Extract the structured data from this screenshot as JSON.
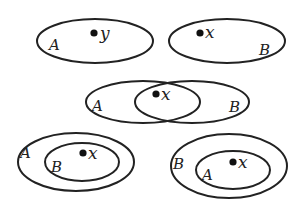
{
  "diagram": {
    "type": "venn-set-relations",
    "stroke_color": "#222222",
    "panels": [
      {
        "id": "disjoint-y-in-A",
        "sets": [
          {
            "label": "A",
            "cx": 95,
            "cy": 41,
            "rx": 58,
            "ry": 22
          }
        ],
        "labels": [
          {
            "text": "A",
            "x": 50,
            "y": 49
          }
        ],
        "point": {
          "label": "y",
          "x": 95,
          "y": 33
        }
      },
      {
        "id": "disjoint-x-in-B",
        "sets": [
          {
            "label": "B",
            "cx": 227,
            "cy": 41,
            "rx": 58,
            "ry": 22
          }
        ],
        "labels": [
          {
            "text": "B",
            "x": 262,
            "y": 53
          }
        ],
        "point": {
          "label": "x",
          "x": 200,
          "y": 33
        }
      },
      {
        "id": "overlap-x-in-A-and-B",
        "sets": [
          {
            "label": "A",
            "cx": 143,
            "cy": 102,
            "rx": 57,
            "ry": 21
          },
          {
            "label": "B",
            "cx": 192,
            "cy": 102,
            "rx": 57,
            "ry": 21
          }
        ],
        "labels": [
          {
            "text": "A",
            "x": 93,
            "y": 110
          },
          {
            "text": "B",
            "x": 230,
            "y": 111
          }
        ],
        "point": {
          "label": "x",
          "x": 156,
          "y": 94
        }
      },
      {
        "id": "B-subset-A-x-in-B",
        "sets": [
          {
            "label": "A",
            "cx": 76,
            "cy": 162,
            "rx": 58,
            "ry": 29
          },
          {
            "label": "B",
            "cx": 82,
            "cy": 162,
            "rx": 37,
            "ry": 19
          }
        ],
        "labels": [
          {
            "text": "A",
            "x": 21,
            "y": 157
          },
          {
            "text": "B",
            "x": 52,
            "y": 171
          }
        ],
        "point": {
          "label": "x",
          "x": 83,
          "y": 153
        }
      },
      {
        "id": "A-subset-B-x-in-A",
        "sets": [
          {
            "label": "B",
            "cx": 229,
            "cy": 166,
            "rx": 58,
            "ry": 32
          },
          {
            "label": "A",
            "cx": 233,
            "cy": 170,
            "rx": 37,
            "ry": 19
          }
        ],
        "labels": [
          {
            "text": "B",
            "x": 174,
            "y": 168
          },
          {
            "text": "A",
            "x": 203,
            "y": 179
          }
        ],
        "point": {
          "label": "x",
          "x": 233,
          "y": 162
        }
      }
    ]
  },
  "text": {
    "p1_set_A": "A",
    "p1_point": "y",
    "p2_set_B": "B",
    "p2_point": "x",
    "p3_set_A": "A",
    "p3_set_B": "B",
    "p3_point": "x",
    "p4_set_A": "A",
    "p4_set_B": "B",
    "p4_point": "x",
    "p5_set_B": "B",
    "p5_set_A": "A",
    "p5_point": "x"
  }
}
